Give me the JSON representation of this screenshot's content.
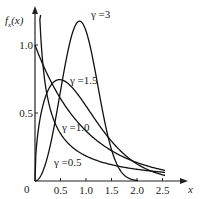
{
  "chart_data": {
    "type": "line",
    "title": "",
    "xlabel": "x",
    "ylabel": "f_x(x)",
    "xlim": [
      0,
      2.6
    ],
    "ylim": [
      0,
      1.3
    ],
    "grid": false,
    "legend": "inline labels",
    "x_ticks": [
      "0.5",
      "1.0",
      "1.5",
      "2.0",
      "2.5"
    ],
    "x_tick_values": [
      0.5,
      1.0,
      1.5,
      2.0,
      2.5
    ],
    "y_ticks": [
      "0.5",
      "1.0"
    ],
    "y_tick_values": [
      0.5,
      1.0
    ],
    "origin_label": "0",
    "series": [
      {
        "name": "γ =0.5",
        "gamma": 0.5,
        "x_max": 2.55,
        "label_pos": [
          54,
          166
        ]
      },
      {
        "name": "γ =1.0",
        "gamma": 1.0,
        "x_max": 2.55,
        "label_pos": [
          62,
          131
        ]
      },
      {
        "name": "γ =1.5",
        "gamma": 1.5,
        "x_max": 2.55,
        "label_pos": [
          70,
          84
        ]
      },
      {
        "name": "γ =3",
        "gamma": 3.0,
        "x_max": 2.02,
        "label_pos": [
          91,
          18
        ]
      }
    ],
    "formula": "f(x) = γ x^(γ-1) exp(-x^γ)"
  },
  "axes": {
    "x_label": "x",
    "y_label_main": "f",
    "y_label_sub": "x",
    "y_label_arg": "(x)"
  }
}
